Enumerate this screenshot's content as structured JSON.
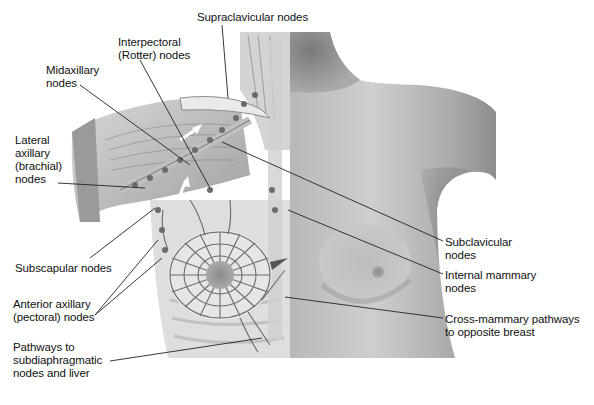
{
  "figure": {
    "labels": [
      {
        "id": "supraclavicular",
        "text": "Supraclavicular nodes",
        "x": 197,
        "y": 11
      },
      {
        "id": "interpectoral",
        "text": "Interpectoral\n(Rotter) nodes",
        "x": 118,
        "y": 36
      },
      {
        "id": "midaxillary",
        "text": "Midaxillary\nnodes",
        "x": 46,
        "y": 64
      },
      {
        "id": "lateral-axillary",
        "text": "Lateral\naxillary\n(brachial)\nnodes",
        "x": 15,
        "y": 134
      },
      {
        "id": "subscapular",
        "text": "Subscapular nodes",
        "x": 15,
        "y": 262
      },
      {
        "id": "anterior-axillary",
        "text": "Anterior axillary\n(pectoral) nodes",
        "x": 13,
        "y": 298
      },
      {
        "id": "subdiaphragmatic",
        "text": "Pathways to\nsubdiaphragmatic\nnodes and liver",
        "x": 13,
        "y": 341
      },
      {
        "id": "subclavicular",
        "text": "Subclavicular\nnodes",
        "x": 445,
        "y": 236
      },
      {
        "id": "internal-mammary",
        "text": "Internal mammary\nnodes",
        "x": 445,
        "y": 269
      },
      {
        "id": "cross-mammary",
        "text": "Cross-mammary pathways\nto opposite breast",
        "x": 445,
        "y": 313
      }
    ],
    "colors": {
      "background": "#ffffff",
      "skin_light": "#c9c9c9",
      "skin_dark": "#8a8a8a",
      "anatomy_light": "#e2e2e2",
      "anatomy_mid": "#a8a8a8",
      "vessel": "#555555",
      "leader_line": "#222222",
      "text": "#111111"
    }
  }
}
